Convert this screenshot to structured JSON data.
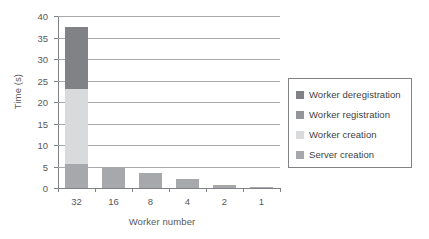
{
  "chart_data": {
    "type": "bar",
    "subtype": "stacked-vertical",
    "title": "",
    "xlabel": "Worker number",
    "ylabel": "Time (s)",
    "categories": [
      "32",
      "16",
      "8",
      "4",
      "2",
      "1"
    ],
    "ylim": [
      0,
      40
    ],
    "yticks": [
      0,
      5,
      10,
      15,
      20,
      25,
      30,
      35,
      40
    ],
    "grid": "horizontal",
    "legend_position": "right",
    "series": [
      {
        "name": "Worker deregistration",
        "color": "#808285",
        "values": [
          14.5,
          0,
          0,
          0,
          0,
          0
        ]
      },
      {
        "name": "Worker registration",
        "color": "#939598",
        "values": [
          0,
          0,
          0,
          0,
          0,
          0
        ]
      },
      {
        "name": "Worker creation",
        "color": "#d9dadb",
        "values": [
          17.5,
          0,
          0,
          0,
          0,
          0
        ]
      },
      {
        "name": "Server creation",
        "color": "#a6a8ab",
        "values": [
          5.5,
          5.0,
          3.6,
          2.1,
          0.8,
          0.15
        ]
      }
    ],
    "totals": [
      37.5,
      5.0,
      3.6,
      2.1,
      0.8,
      0.15
    ]
  }
}
